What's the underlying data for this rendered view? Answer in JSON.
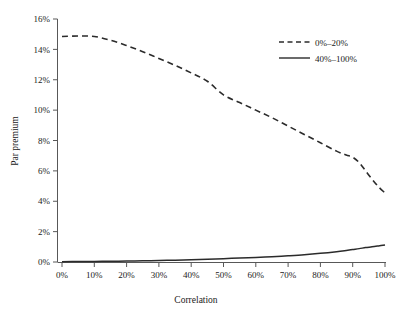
{
  "chart_data": {
    "type": "line",
    "title": "",
    "xlabel": "Correlation",
    "ylabel": "Par premium",
    "xlim": [
      0,
      100
    ],
    "ylim": [
      0,
      16
    ],
    "grid": false,
    "legend_position": "top-right",
    "x_tick_labels": [
      "0%",
      "10%",
      "20%",
      "30%",
      "40%",
      "50%",
      "60%",
      "70%",
      "80%",
      "90%",
      "100%"
    ],
    "x_ticks": [
      0,
      10,
      20,
      30,
      40,
      50,
      60,
      70,
      80,
      90,
      100
    ],
    "y_tick_labels": [
      "0%",
      "2%",
      "4%",
      "6%",
      "8%",
      "10%",
      "12%",
      "14%",
      "16%"
    ],
    "y_ticks": [
      0,
      2,
      4,
      6,
      8,
      10,
      12,
      14,
      16
    ],
    "x": [
      0,
      5,
      10,
      15,
      20,
      25,
      30,
      35,
      40,
      45,
      50,
      55,
      60,
      65,
      70,
      75,
      80,
      85,
      88,
      90,
      92,
      94,
      96,
      98,
      100
    ],
    "series": [
      {
        "name": "0%–20%",
        "style": "dashed",
        "color": "#2b2b2b",
        "values": [
          14.85,
          14.88,
          14.85,
          14.6,
          14.25,
          13.85,
          13.4,
          12.95,
          12.45,
          11.9,
          11.0,
          10.5,
          10.0,
          9.5,
          8.95,
          8.4,
          7.85,
          7.3,
          7.05,
          6.9,
          6.55,
          6.0,
          5.45,
          4.95,
          4.55
        ]
      },
      {
        "name": "40%–100%",
        "style": "solid",
        "color": "#2b2b2b",
        "values": [
          0.02,
          0.03,
          0.04,
          0.05,
          0.06,
          0.08,
          0.1,
          0.12,
          0.15,
          0.18,
          0.22,
          0.26,
          0.3,
          0.35,
          0.41,
          0.48,
          0.57,
          0.68,
          0.76,
          0.82,
          0.88,
          0.95,
          1.0,
          1.06,
          1.12
        ]
      }
    ],
    "legend_entries": [
      "0%–20%",
      "40%–100%"
    ]
  },
  "axes": {
    "y_title": "Par premium",
    "x_title": "Correlation"
  },
  "colors": {
    "axis": "#585858",
    "series": "#2b2b2b",
    "background": "#ffffff",
    "text": "#1a1a1a"
  }
}
